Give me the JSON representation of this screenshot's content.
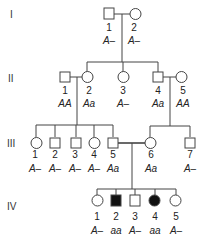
{
  "diagram": {
    "type": "pedigree",
    "generations": [
      {
        "label": "I",
        "members": [
          {
            "id": "I-1",
            "number": "1",
            "sex": "male",
            "affected": false,
            "genotype": "A–"
          },
          {
            "id": "I-2",
            "number": "2",
            "sex": "female",
            "affected": false,
            "genotype": "A–"
          }
        ]
      },
      {
        "label": "II",
        "members": [
          {
            "id": "II-1",
            "number": "1",
            "sex": "male",
            "affected": false,
            "genotype": "AA"
          },
          {
            "id": "II-2",
            "number": "2",
            "sex": "female",
            "affected": false,
            "genotype": "Aa"
          },
          {
            "id": "II-3",
            "number": "3",
            "sex": "female",
            "affected": false,
            "genotype": "A–"
          },
          {
            "id": "II-4",
            "number": "4",
            "sex": "male",
            "affected": false,
            "genotype": "Aa"
          },
          {
            "id": "II-5",
            "number": "5",
            "sex": "female",
            "affected": false,
            "genotype": "AA"
          }
        ]
      },
      {
        "label": "III",
        "members": [
          {
            "id": "III-1",
            "number": "1",
            "sex": "female",
            "affected": false,
            "genotype": "A–"
          },
          {
            "id": "III-2",
            "number": "2",
            "sex": "male",
            "affected": false,
            "genotype": "A–"
          },
          {
            "id": "III-3",
            "number": "3",
            "sex": "male",
            "affected": false,
            "genotype": "A–"
          },
          {
            "id": "III-4",
            "number": "4",
            "sex": "female",
            "affected": false,
            "genotype": "A–"
          },
          {
            "id": "III-5",
            "number": "5",
            "sex": "male",
            "affected": false,
            "genotype": "Aa"
          },
          {
            "id": "III-6",
            "number": "6",
            "sex": "female",
            "affected": false,
            "genotype": "Aa"
          },
          {
            "id": "III-7",
            "number": "7",
            "sex": "male",
            "affected": false,
            "genotype": "A–"
          }
        ]
      },
      {
        "label": "IV",
        "members": [
          {
            "id": "IV-1",
            "number": "1",
            "sex": "female",
            "affected": false,
            "genotype": "A–"
          },
          {
            "id": "IV-2",
            "number": "2",
            "sex": "male",
            "affected": true,
            "genotype": "aa"
          },
          {
            "id": "IV-3",
            "number": "3",
            "sex": "male",
            "affected": false,
            "genotype": "A–"
          },
          {
            "id": "IV-4",
            "number": "4",
            "sex": "female",
            "affected": true,
            "genotype": "aa"
          },
          {
            "id": "IV-5",
            "number": "5",
            "sex": "female",
            "affected": false,
            "genotype": "A–"
          }
        ]
      }
    ],
    "matings": [
      {
        "partners": [
          "I-1",
          "I-2"
        ],
        "children": [
          "II-2",
          "II-3",
          "II-4"
        ]
      },
      {
        "partners": [
          "II-1",
          "II-2"
        ],
        "children": [
          "III-1",
          "III-2",
          "III-3",
          "III-4",
          "III-5"
        ]
      },
      {
        "partners": [
          "II-4",
          "II-5"
        ],
        "children": [
          "III-6",
          "III-7"
        ]
      },
      {
        "partners": [
          "III-5",
          "III-6"
        ],
        "children": [
          "IV-1",
          "IV-2",
          "IV-3",
          "IV-4",
          "IV-5"
        ]
      }
    ],
    "legend": {
      "filled_symbol": "affected (aa)",
      "open_symbol": "unaffected"
    }
  }
}
